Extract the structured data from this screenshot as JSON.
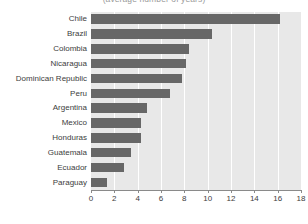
{
  "chart_data": {
    "type": "bar",
    "orientation": "horizontal",
    "title": "",
    "subtitle": "(average number of years)",
    "xlabel": "",
    "ylabel": "",
    "xlim": [
      0,
      18
    ],
    "xticks": [
      0,
      2,
      4,
      6,
      8,
      10,
      12,
      14,
      16,
      18
    ],
    "grid": "vertical",
    "legend": "none",
    "bar_color": "#676767",
    "plot_background": "#e8e8e8",
    "categories": [
      "Chile",
      "Brazil",
      "Colombia",
      "Nicaragua",
      "Dominican Republic",
      "Peru",
      "Argentina",
      "Mexico",
      "Honduras",
      "Guatemala",
      "Ecuador",
      "Paraguay"
    ],
    "values": [
      16.2,
      10.4,
      8.4,
      8.1,
      7.8,
      6.8,
      4.8,
      4.3,
      4.3,
      3.4,
      2.8,
      1.4
    ]
  }
}
